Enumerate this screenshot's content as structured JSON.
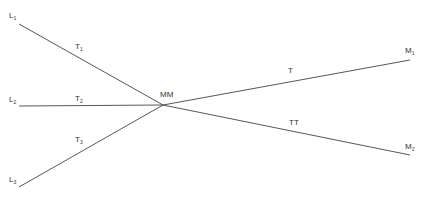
{
  "diagram": {
    "nodes": {
      "L1": {
        "label": "L",
        "sub": "1"
      },
      "L2": {
        "label": "L",
        "sub": "2"
      },
      "L3": {
        "label": "L",
        "sub": "3"
      },
      "MM": {
        "label": "MM"
      },
      "M1": {
        "label": "M",
        "sub": "1"
      },
      "M2": {
        "label": "M",
        "sub": "2"
      }
    },
    "edges": {
      "T1": {
        "label": "T",
        "sub": "1"
      },
      "T2": {
        "label": "T",
        "sub": "2"
      },
      "T3": {
        "label": "T",
        "sub": "3"
      },
      "T": {
        "label": "T"
      },
      "TT": {
        "label": "TT"
      }
    },
    "line_color": "#444444",
    "caption": ""
  }
}
